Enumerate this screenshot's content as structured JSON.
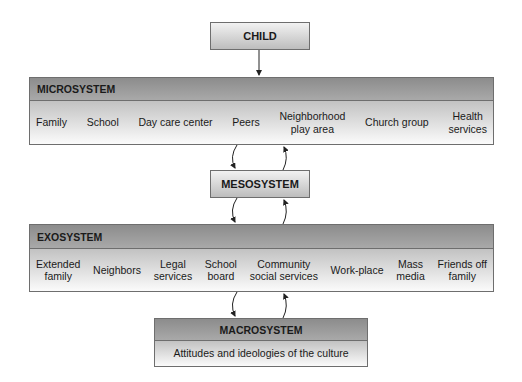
{
  "child": {
    "label": "CHILD"
  },
  "microsystem": {
    "title": "MICROSYSTEM",
    "items": [
      "Family",
      "School",
      "Day care center",
      "Peers",
      "Neighborhood\nplay area",
      "Church group",
      "Health\nservices"
    ]
  },
  "mesosystem": {
    "label": "MESOSYSTEM"
  },
  "exosystem": {
    "title": "EXOSYSTEM",
    "items": [
      "Extended\nfamily",
      "Neighbors",
      "Legal\nservices",
      "School\nboard",
      "Community\nsocial services",
      "Work-place",
      "Mass\nmedia",
      "Friends off\nfamily"
    ]
  },
  "macrosystem": {
    "title": "MACROSYSTEM",
    "description": "Attitudes and ideologies of the culture"
  }
}
